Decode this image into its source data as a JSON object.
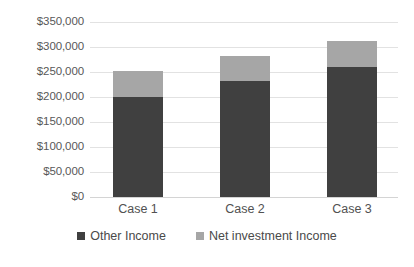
{
  "chart_data": {
    "type": "bar",
    "barmode": "stacked",
    "title": "",
    "xlabel": "",
    "ylabel": "",
    "categories": [
      "Case 1",
      "Case 2",
      "Case 3"
    ],
    "series": [
      {
        "name": "Other Income",
        "color": "#404040",
        "values": [
          200000,
          232000,
          260000
        ]
      },
      {
        "name": "Net investment Income",
        "color": "#a6a6a6",
        "values": [
          52000,
          50000,
          52000
        ]
      }
    ],
    "totals": [
      252000,
      282000,
      312000
    ],
    "ylim": [
      0,
      350000
    ],
    "ytick_step": 50000,
    "ytick_labels": [
      "$350,000",
      "$300,000",
      "$250,000",
      "$200,000",
      "$150,000",
      "$100,000",
      "$50,000",
      "$0"
    ],
    "ytick_values": [
      350000,
      300000,
      250000,
      200000,
      150000,
      100000,
      50000,
      0
    ],
    "grid": true,
    "legend_position": "bottom"
  },
  "legend": {
    "items": [
      {
        "label": "Other Income",
        "color": "#404040"
      },
      {
        "label": "Net investment Income",
        "color": "#a6a6a6"
      }
    ]
  },
  "axis": {
    "y": {
      "labels": [
        "$350,000",
        "$300,000",
        "$250,000",
        "$200,000",
        "$150,000",
        "$100,000",
        "$50,000",
        "$0"
      ]
    },
    "x": {
      "labels": [
        "Case 1",
        "Case 2",
        "Case 3"
      ]
    }
  }
}
